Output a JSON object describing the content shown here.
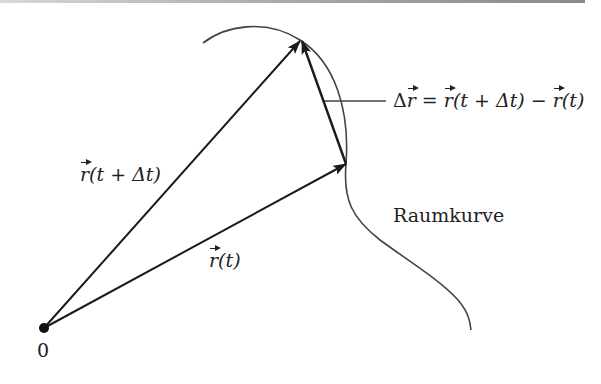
{
  "diagram": {
    "type": "vector-difference-space-curve",
    "colors": {
      "arrow": "#1a1a1a",
      "curve": "#444444",
      "text": "#222222",
      "background": "#ffffff"
    },
    "origin": {
      "label": "0",
      "x": 44,
      "y": 328
    },
    "curve": {
      "label": "Raumkurve"
    },
    "vectors": [
      {
        "name": "r(t)",
        "from": [
          44,
          328
        ],
        "to": [
          346,
          164
        ],
        "label_vec": "r",
        "label_args": "(t)"
      },
      {
        "name": "r(t+Δt)",
        "from": [
          44,
          328
        ],
        "to": [
          300,
          41
        ],
        "label_vec": "r",
        "label_args": "(t + Δt)"
      },
      {
        "name": "Δr",
        "from": [
          346,
          164
        ],
        "to": [
          302,
          41
        ]
      }
    ],
    "labels": {
      "r_t": {
        "vec": "r",
        "args": "(t)"
      },
      "r_t_dt": {
        "vec": "r",
        "args_open": "(",
        "t": "t",
        "plus": " + Δ",
        "t2": "t",
        "close": ")"
      },
      "delta_r": {
        "delta": "Δ",
        "vec": "r",
        "eq": " = ",
        "rhs1_vec": "r",
        "rhs1_args": "(t + Δt)",
        "minus": " − ",
        "rhs2_vec": "r",
        "rhs2_args": "(t)"
      },
      "raumkurve": "Raumkurve",
      "origin": "0"
    }
  }
}
